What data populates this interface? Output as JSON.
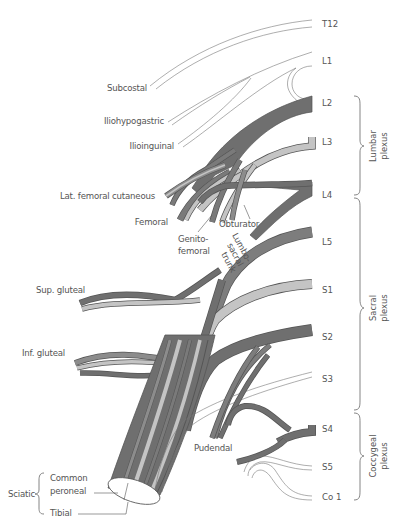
{
  "figure": {
    "colors": {
      "dark_nerve": "#6f6f6f",
      "medium_nerve": "#8c8c8c",
      "light_nerve": "#c4c4c4",
      "outline": "#555555",
      "text": "#555555",
      "background": "#ffffff"
    },
    "spinal_roots": [
      {
        "id": "T12",
        "label": "T12"
      },
      {
        "id": "L1",
        "label": "L1"
      },
      {
        "id": "L2",
        "label": "L2"
      },
      {
        "id": "L3",
        "label": "L3"
      },
      {
        "id": "L4",
        "label": "L4"
      },
      {
        "id": "L5",
        "label": "L5"
      },
      {
        "id": "S1",
        "label": "S1"
      },
      {
        "id": "S2",
        "label": "S2"
      },
      {
        "id": "S3",
        "label": "S3"
      },
      {
        "id": "S4",
        "label": "S4"
      },
      {
        "id": "S5",
        "label": "S5"
      },
      {
        "id": "Co1",
        "label": "Co 1"
      }
    ],
    "plexuses": [
      {
        "line1": "Lumbar",
        "line2": "plexus",
        "range": "L2–L4"
      },
      {
        "line1": "Sacral",
        "line2": "plexus",
        "range": "L4–S4"
      },
      {
        "line1": "Coccygeal",
        "line2": "plexus",
        "range": "S4–Co 1"
      }
    ],
    "nerves": {
      "subcostal": "Subcostal",
      "iliohypogastric": "Iliohypogastric",
      "ilioinguinal": "Ilioinguinal",
      "lat_femoral_cutaneous": "Lat. femoral cutaneous",
      "femoral": "Femoral",
      "genitofemoral_1": "Genito-",
      "genitofemoral_2": "femoral",
      "obturator": "Obturator",
      "lumbosacral_1": "Lumbo-",
      "lumbosacral_2": "sacral",
      "lumbosacral_3": "trunk",
      "sup_gluteal": "Sup. gluteal",
      "inf_gluteal": "Inf. gluteal",
      "pudendal": "Pudendal",
      "sciatic": "Sciatic",
      "common_peroneal_1": "Common",
      "common_peroneal_2": "peroneal",
      "tibial": "Tibial"
    }
  }
}
